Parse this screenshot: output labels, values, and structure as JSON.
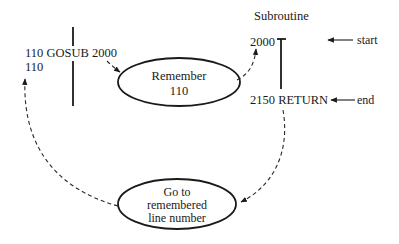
{
  "diagram": {
    "main_program": {
      "call_line": "110 GOSUB 2000",
      "return_line": "110"
    },
    "subroutine": {
      "title": "Subroutine",
      "start_line": "2000",
      "end_line": "2150 RETURN",
      "start_label": "start",
      "end_label": "end"
    },
    "remember_node": {
      "line1": "Remember",
      "line2": "110"
    },
    "goto_node": {
      "line1": "Go to",
      "line2": "remembered",
      "line3": "line number"
    },
    "colors": {
      "ink": "#1a1a1a",
      "background": "#ffffff"
    }
  }
}
